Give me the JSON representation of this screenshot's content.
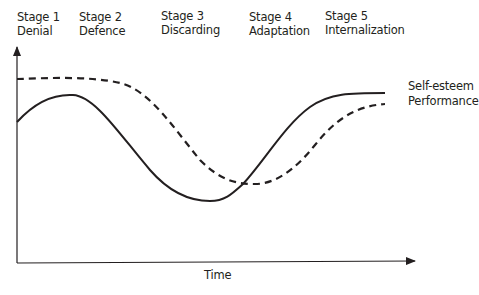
{
  "stages": [
    {
      "number": "Stage 1",
      "name": "Denial",
      "x": 17
    },
    {
      "number": "Stage 2",
      "name": "Defence",
      "x": 79
    },
    {
      "number": "Stage 3",
      "name": "Discarding",
      "x": 161
    },
    {
      "number": "Stage 4",
      "name": "Adaptation",
      "x": 249
    },
    {
      "number": "Stage 5",
      "name": "Internalization",
      "x": 325
    }
  ],
  "axes": {
    "x_label": "Time",
    "y_label": ""
  },
  "legend": {
    "self_esteem": "Self-esteem",
    "performance": "Performance"
  },
  "colors": {
    "ink": "#231f20",
    "background": "#ffffff"
  },
  "chart_data": {
    "type": "line",
    "title": "",
    "xlabel": "Time",
    "ylabel": "",
    "grid": false,
    "legend_position": "inline-right",
    "x_categories": [
      "Stage 1 Denial",
      "Stage 2 Defence",
      "Stage 3 Discarding",
      "Stage 4 Adaptation",
      "Stage 5 Internalization"
    ],
    "series": [
      {
        "name": "Self-esteem",
        "style": "solid",
        "x": [
          0,
          0.14,
          0.25,
          0.4,
          0.48,
          0.56,
          0.64,
          0.8,
          0.88,
          0.95
        ],
        "y": [
          0.65,
          0.78,
          0.72,
          0.35,
          0.28,
          0.3,
          0.48,
          0.76,
          0.78,
          0.78
        ]
      },
      {
        "name": "Performance",
        "style": "dashed",
        "x": [
          0,
          0.12,
          0.22,
          0.32,
          0.45,
          0.58,
          0.66,
          0.78,
          0.88,
          0.95
        ],
        "y": [
          0.86,
          0.87,
          0.84,
          0.7,
          0.42,
          0.36,
          0.4,
          0.62,
          0.72,
          0.73
        ]
      }
    ],
    "xlim": [
      0,
      1
    ],
    "ylim": [
      0,
      1
    ]
  }
}
